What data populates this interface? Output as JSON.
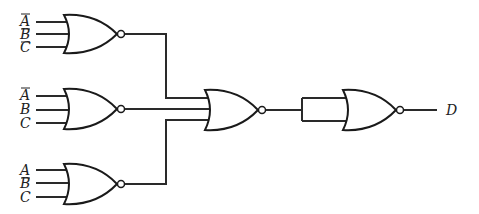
{
  "diagram": {
    "type": "logic-circuit",
    "gate_type": "NOR",
    "output_label": "D",
    "gates": [
      {
        "id": "nor1",
        "inputs": [
          {
            "label": "A",
            "inverted": true
          },
          {
            "label": "B",
            "inverted": true
          },
          {
            "label": "C",
            "inverted": true
          }
        ]
      },
      {
        "id": "nor2",
        "inputs": [
          {
            "label": "A",
            "inverted": true
          },
          {
            "label": "B",
            "inverted": false
          },
          {
            "label": "C",
            "inverted": false
          }
        ]
      },
      {
        "id": "nor3",
        "inputs": [
          {
            "label": "A",
            "inverted": false
          },
          {
            "label": "B",
            "inverted": true
          },
          {
            "label": "C",
            "inverted": false
          }
        ]
      },
      {
        "id": "nor4",
        "inputs": [
          "nor1",
          "nor2",
          "nor3"
        ]
      },
      {
        "id": "nor5",
        "inputs": [
          "nor4",
          "nor4"
        ]
      }
    ]
  },
  "labels": {
    "g1": [
      "A",
      "B",
      "C"
    ],
    "g2": [
      "A",
      "B",
      "C"
    ],
    "g3": [
      "A",
      "B",
      "C"
    ],
    "out": "D"
  }
}
